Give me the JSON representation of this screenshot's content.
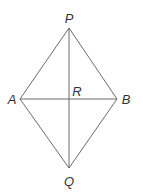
{
  "diagram": {
    "type": "geometry-figure",
    "shape": "rhombus",
    "vertices": {
      "P": {
        "label": "P",
        "x": 69,
        "y": 28,
        "label_x": 69,
        "label_y": 23
      },
      "A": {
        "label": "A",
        "x": 20,
        "y": 99,
        "label_x": 12,
        "label_y": 104
      },
      "B": {
        "label": "B",
        "x": 117,
        "y": 99,
        "label_x": 126,
        "label_y": 104
      },
      "Q": {
        "label": "Q",
        "x": 69,
        "y": 168,
        "label_x": 69,
        "label_y": 186
      }
    },
    "intersection": {
      "label": "R",
      "x": 69,
      "y": 99,
      "label_x": 77,
      "label_y": 96
    },
    "edges": [
      [
        "P",
        "A"
      ],
      [
        "P",
        "B"
      ],
      [
        "A",
        "Q"
      ],
      [
        "B",
        "Q"
      ]
    ],
    "diagonals": [
      [
        "P",
        "Q"
      ],
      [
        "A",
        "B"
      ]
    ],
    "colors": {
      "line": "#5a5a5a",
      "text": "#333333",
      "background": "#ffffff"
    }
  }
}
